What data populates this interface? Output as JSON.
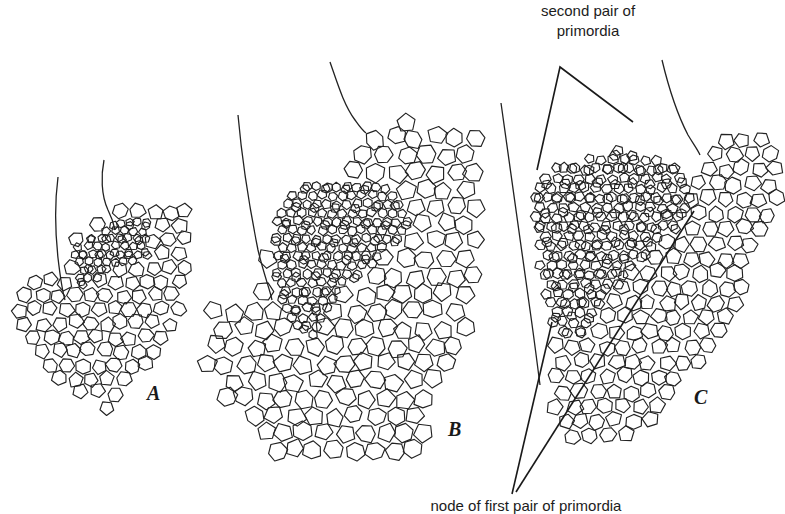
{
  "figure": {
    "type": "botanical-line-drawing",
    "panels": [
      {
        "id": "A",
        "letter": "A"
      },
      {
        "id": "B",
        "letter": "B"
      },
      {
        "id": "C",
        "letter": "C"
      }
    ],
    "annotations": {
      "top": {
        "line1": "second pair of",
        "line2": "primordia"
      },
      "bottom": {
        "text": "node of first pair of primordia"
      }
    },
    "colors": {
      "ink": "#1a1a1a",
      "paper": "#ffffff"
    }
  }
}
